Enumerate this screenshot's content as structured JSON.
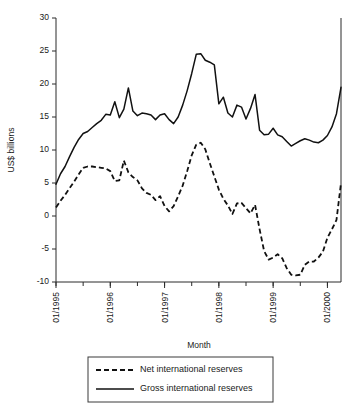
{
  "chart_data": {
    "type": "line",
    "title": "",
    "xlabel": "Month",
    "ylabel": "US$ billions",
    "ylim": [
      -10,
      30
    ],
    "yticks": [
      -10,
      -5,
      0,
      5,
      10,
      15,
      20,
      25,
      30
    ],
    "ytick_labels": [
      "-10",
      "-5",
      "0",
      "5",
      "10",
      "15",
      "20",
      "25",
      "30"
    ],
    "xtick_labels": [
      "01/1995",
      "01/1996",
      "01/1997",
      "01/1998",
      "01/1999",
      "01/2000"
    ],
    "xtick_index": [
      0,
      12,
      24,
      36,
      48,
      60
    ],
    "x_minor_every": 6,
    "grid": false,
    "legend_position": "below-plot",
    "x": [
      "01/1995",
      "02/1995",
      "03/1995",
      "04/1995",
      "05/1995",
      "06/1995",
      "07/1995",
      "08/1995",
      "09/1995",
      "10/1995",
      "11/1995",
      "12/1995",
      "01/1996",
      "02/1996",
      "03/1996",
      "04/1996",
      "05/1996",
      "06/1996",
      "07/1996",
      "08/1996",
      "09/1996",
      "10/1996",
      "11/1996",
      "12/1996",
      "01/1997",
      "02/1997",
      "03/1997",
      "04/1997",
      "05/1997",
      "06/1997",
      "07/1997",
      "08/1997",
      "09/1997",
      "10/1997",
      "11/1997",
      "12/1997",
      "01/1998",
      "02/1998",
      "03/1998",
      "04/1998",
      "05/1998",
      "06/1998",
      "07/1998",
      "08/1998",
      "09/1998",
      "10/1998",
      "11/1998",
      "12/1998",
      "01/1999",
      "02/1999",
      "03/1999",
      "04/1999",
      "05/1999",
      "06/1999",
      "07/1999",
      "08/1999",
      "09/1999",
      "10/1999",
      "11/1999",
      "12/1999",
      "01/2000",
      "02/2000",
      "03/2000",
      "04/2000"
    ],
    "series": [
      {
        "name": "Net international reserves",
        "style": "dashed",
        "values": [
          1.3,
          2.3,
          3.2,
          4.2,
          5.2,
          6.3,
          7.3,
          7.5,
          7.5,
          7.4,
          7.3,
          7.2,
          6.8,
          5.3,
          5.4,
          8.4,
          6.6,
          5.9,
          5.4,
          4.2,
          3.5,
          3.2,
          2.4,
          3.0,
          1.5,
          0.7,
          1.5,
          3.0,
          4.6,
          6.8,
          9.2,
          10.8,
          11.1,
          10.1,
          8.0,
          6.0,
          4.0,
          2.6,
          1.6,
          0.3,
          1.9,
          2.0,
          1.2,
          0.4,
          1.7,
          -2.0,
          -5.3,
          -6.6,
          -6.3,
          -5.8,
          -6.4,
          -7.9,
          -8.9,
          -9.0,
          -8.9,
          -7.4,
          -6.9,
          -6.9,
          -6.3,
          -5.4,
          -3.3,
          -2.0,
          -0.6,
          5.0
        ]
      },
      {
        "name": "Gross international reserves",
        "style": "solid",
        "values": [
          4.8,
          6.4,
          7.5,
          9.0,
          10.4,
          11.6,
          12.5,
          12.8,
          13.4,
          14.0,
          14.5,
          15.4,
          15.3,
          17.3,
          14.9,
          16.2,
          19.4,
          15.9,
          15.2,
          15.6,
          15.5,
          15.3,
          14.6,
          15.3,
          15.5,
          14.6,
          14.0,
          15.0,
          16.8,
          19.0,
          21.6,
          24.5,
          24.6,
          23.6,
          23.3,
          22.9,
          17.0,
          18.0,
          15.6,
          15.0,
          16.8,
          16.5,
          14.7,
          16.3,
          18.4,
          13.0,
          12.3,
          12.4,
          13.3,
          12.3,
          12.0,
          11.3,
          10.6,
          11.0,
          11.4,
          11.7,
          11.5,
          11.2,
          11.1,
          11.5,
          12.2,
          13.5,
          15.5,
          19.5
        ]
      }
    ]
  },
  "legend": {
    "items": [
      {
        "label": "Net international reserves",
        "style": "dashed"
      },
      {
        "label": "Gross international reserves",
        "style": "solid"
      }
    ]
  }
}
